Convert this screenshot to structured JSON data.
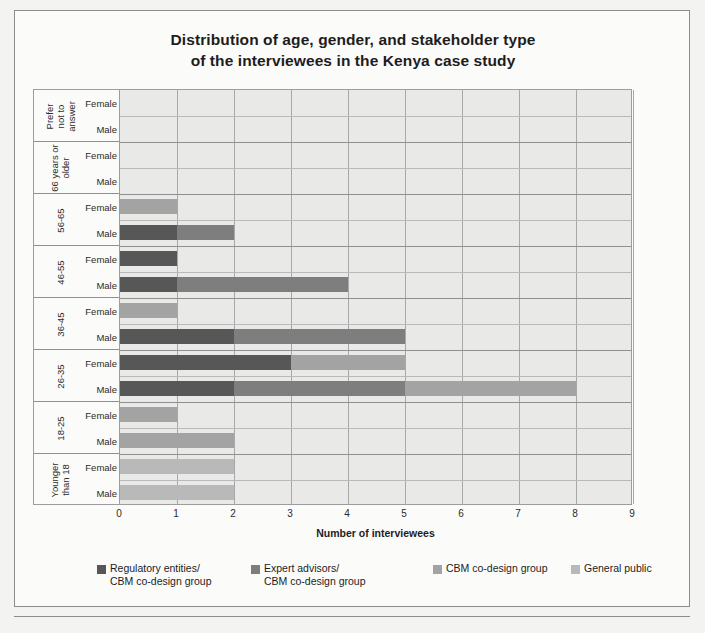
{
  "chart_data": {
    "type": "bar",
    "orientation": "horizontal",
    "stacked": true,
    "title": "Distribution of age, gender, and stakeholder type\nof the interviewees in the Kenya case study",
    "title_line1": "Distribution of age, gender, and stakeholder type",
    "title_line2": "of the interviewees in the Kenya case study",
    "xlabel": "Number of interviewees",
    "ylabel": "",
    "xlim": [
      0,
      9
    ],
    "xticks": [
      0,
      1,
      2,
      3,
      4,
      5,
      6,
      7,
      8,
      9
    ],
    "grid": true,
    "legend_position": "bottom",
    "age_groups": [
      "Prefer not to answer",
      "66 years or older",
      "56-65",
      "46-55",
      "36-45",
      "26-35",
      "18-25",
      "Younger than 18"
    ],
    "age_group_labels": [
      [
        "Prefer",
        "not to",
        "answer"
      ],
      [
        "66 years or",
        "older"
      ],
      [
        "56-65"
      ],
      [
        "46-55"
      ],
      [
        "36-45"
      ],
      [
        "26-35"
      ],
      [
        "18-25"
      ],
      [
        "Younger",
        "than 18"
      ]
    ],
    "genders": [
      "Female",
      "Male"
    ],
    "series": [
      {
        "name": "Regulatory entities/\nCBM co-design group",
        "name_line1": "Regulatory entities/",
        "name_line2": "CBM co-design group",
        "color": "#575757"
      },
      {
        "name": "Expert advisors/\nCBM co-design group",
        "name_line1": "Expert advisors/",
        "name_line2": "CBM co-design group",
        "color": "#7e7e7e"
      },
      {
        "name": "CBM co-design group",
        "name_line1": "CBM co-design group",
        "name_line2": "",
        "color": "#a3a3a3"
      },
      {
        "name": "General public",
        "name_line1": "General public",
        "name_line2": "",
        "color": "#b9b9b9"
      }
    ],
    "bars": [
      {
        "age": "Prefer not to answer",
        "gender": "Female",
        "values": [
          0,
          0,
          0,
          0
        ],
        "total": 0
      },
      {
        "age": "Prefer not to answer",
        "gender": "Male",
        "values": [
          0,
          0,
          0,
          0
        ],
        "total": 0
      },
      {
        "age": "66 years or older",
        "gender": "Female",
        "values": [
          0,
          0,
          0,
          0
        ],
        "total": 0
      },
      {
        "age": "66 years or older",
        "gender": "Male",
        "values": [
          0,
          0,
          0,
          0
        ],
        "total": 0
      },
      {
        "age": "56-65",
        "gender": "Female",
        "values": [
          0,
          0,
          1,
          0
        ],
        "total": 1
      },
      {
        "age": "56-65",
        "gender": "Male",
        "values": [
          1,
          1,
          0,
          0
        ],
        "total": 2
      },
      {
        "age": "46-55",
        "gender": "Female",
        "values": [
          1,
          0,
          0,
          0
        ],
        "total": 1
      },
      {
        "age": "46-55",
        "gender": "Male",
        "values": [
          1,
          3,
          0,
          0
        ],
        "total": 4
      },
      {
        "age": "36-45",
        "gender": "Female",
        "values": [
          0,
          0,
          1,
          0
        ],
        "total": 1
      },
      {
        "age": "36-45",
        "gender": "Male",
        "values": [
          2,
          3,
          0,
          0
        ],
        "total": 5
      },
      {
        "age": "26-35",
        "gender": "Female",
        "values": [
          3,
          0,
          2,
          0
        ],
        "total": 5
      },
      {
        "age": "26-35",
        "gender": "Male",
        "values": [
          2,
          3,
          3,
          0
        ],
        "total": 8
      },
      {
        "age": "18-25",
        "gender": "Female",
        "values": [
          0,
          0,
          1,
          0
        ],
        "total": 1
      },
      {
        "age": "18-25",
        "gender": "Male",
        "values": [
          0,
          0,
          2,
          0
        ],
        "total": 2
      },
      {
        "age": "Younger than 18",
        "gender": "Female",
        "values": [
          0,
          0,
          0,
          2
        ],
        "total": 2
      },
      {
        "age": "Younger than 18",
        "gender": "Male",
        "values": [
          0,
          0,
          0,
          2
        ],
        "total": 2
      }
    ]
  },
  "background_text": {
    "lines": [
      "Materials and methods",
      "Figure methods and discussion",
      "the interviews in the Kenya case",
      "methods of the chart"
    ]
  }
}
